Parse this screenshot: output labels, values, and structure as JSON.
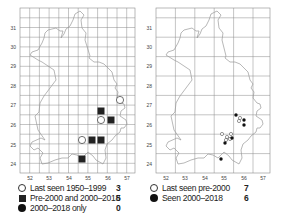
{
  "maps": [
    {
      "id": "left",
      "grid": {
        "x0": 20,
        "y0": 8,
        "x1": 135,
        "y1": 173,
        "minor_step": 9.7
      },
      "x_ticks": [
        {
          "label": "52",
          "x": 30
        },
        {
          "label": "53",
          "x": 49
        },
        {
          "label": "54",
          "x": 69
        },
        {
          "label": "55",
          "x": 88
        },
        {
          "label": "56",
          "x": 108
        },
        {
          "label": "57",
          "x": 127
        }
      ],
      "y_ticks": [
        {
          "label": "31",
          "y": 28
        },
        {
          "label": "30",
          "y": 47
        },
        {
          "label": "29",
          "y": 66
        },
        {
          "label": "28",
          "y": 86
        },
        {
          "label": "27",
          "y": 105
        },
        {
          "label": "26",
          "y": 125
        },
        {
          "label": "25",
          "y": 145
        },
        {
          "label": "24",
          "y": 164
        }
      ],
      "symbols": [
        {
          "type": "open",
          "x": 120,
          "y": 100
        },
        {
          "type": "square",
          "x": 101,
          "y": 111
        },
        {
          "type": "open",
          "x": 101,
          "y": 120
        },
        {
          "type": "square",
          "x": 111,
          "y": 120
        },
        {
          "type": "open",
          "x": 82,
          "y": 140
        },
        {
          "type": "square",
          "x": 92,
          "y": 140
        },
        {
          "type": "square",
          "x": 101,
          "y": 140
        },
        {
          "type": "square",
          "x": 82,
          "y": 159
        }
      ],
      "legend": [
        {
          "symbol": "open",
          "label": "Last seen 1950–1999",
          "count": "3"
        },
        {
          "symbol": "square",
          "label": "Pre-2000 and 2000–2018",
          "count": "5"
        },
        {
          "symbol": "filled",
          "label": "2000–2018 only",
          "count": "0"
        }
      ]
    },
    {
      "id": "right",
      "grid": {
        "x0": 156,
        "y0": 8,
        "x1": 270,
        "y1": 173,
        "minor_step": 19.4
      },
      "x_ticks": [
        {
          "label": "52",
          "x": 166
        },
        {
          "label": "53",
          "x": 185
        },
        {
          "label": "54",
          "x": 205
        },
        {
          "label": "55",
          "x": 224
        },
        {
          "label": "56",
          "x": 244
        },
        {
          "label": "57",
          "x": 263
        }
      ],
      "y_ticks": [
        {
          "label": "31",
          "y": 28
        },
        {
          "label": "30",
          "y": 47
        },
        {
          "label": "29",
          "y": 66
        },
        {
          "label": "28",
          "y": 86
        },
        {
          "label": "27",
          "y": 105
        },
        {
          "label": "26",
          "y": 125
        },
        {
          "label": "25",
          "y": 145
        },
        {
          "label": "24",
          "y": 164
        }
      ],
      "symbols": [
        {
          "type": "open",
          "x": 240,
          "y": 118
        },
        {
          "type": "open",
          "x": 239,
          "y": 121
        },
        {
          "type": "open",
          "x": 222,
          "y": 134
        },
        {
          "type": "open",
          "x": 231,
          "y": 134
        },
        {
          "type": "open",
          "x": 227,
          "y": 137
        },
        {
          "type": "open",
          "x": 230,
          "y": 139
        },
        {
          "type": "open",
          "x": 226,
          "y": 140
        },
        {
          "type": "filled",
          "x": 236,
          "y": 115
        },
        {
          "type": "filled",
          "x": 244,
          "y": 120
        },
        {
          "type": "filled",
          "x": 244,
          "y": 125
        },
        {
          "type": "filled",
          "x": 232,
          "y": 138
        },
        {
          "type": "filled",
          "x": 225,
          "y": 143
        },
        {
          "type": "filled",
          "x": 221,
          "y": 159
        }
      ],
      "legend": [
        {
          "symbol": "open",
          "label": "Last seen pre-2000",
          "count": "7"
        },
        {
          "symbol": "filled",
          "label": "Seen 2000–2018",
          "count": "6"
        }
      ]
    }
  ],
  "colors": {
    "grid": "#8a8a8a",
    "outline": "#9a9a9a",
    "symbol": "#1a1a1a"
  }
}
